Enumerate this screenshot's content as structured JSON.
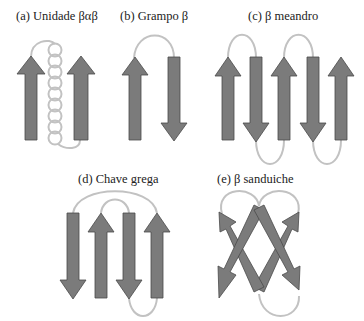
{
  "panels": {
    "a": {
      "label": "(a) Unidade βαβ",
      "description": "beta-alpha-beta unit: two parallel up strands connected by alpha helix"
    },
    "b": {
      "label": "(b) Grampo β",
      "description": "beta hairpin: two antiparallel strands"
    },
    "c": {
      "label": "(c) β meandro",
      "description": "beta meander: five antiparallel strands"
    },
    "d": {
      "label": "(d) Chave grega",
      "description": "Greek key: four antiparallel strands"
    },
    "e": {
      "label": "(e) β sanduiche",
      "description": "beta sandwich: four crossing strands"
    }
  },
  "colors": {
    "strand_fill": "#7b7b7b",
    "strand_outline": "#4a4a4a",
    "loop": "#c2c2c2"
  }
}
